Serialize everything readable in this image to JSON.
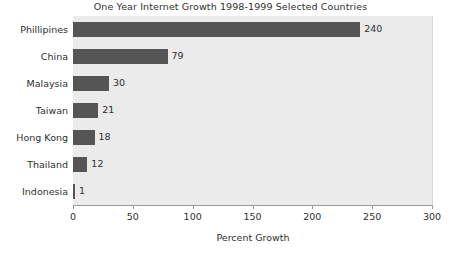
{
  "chart_data": {
    "type": "bar",
    "orientation": "horizontal",
    "title": "One Year Internet Growth 1998-1999 Selected Countries",
    "xlabel": "Percent Growth",
    "ylabel": "",
    "categories": [
      "Phillipines",
      "China",
      "Malaysia",
      "Taiwan",
      "Hong Kong",
      "Thailand",
      "Indonesia"
    ],
    "values": [
      240,
      79,
      30,
      21,
      18,
      12,
      1
    ],
    "value_labels": [
      "240",
      "79",
      "30",
      "21",
      "18",
      "12",
      "1"
    ],
    "xlim": [
      0,
      300
    ],
    "xticks": [
      0,
      50,
      100,
      150,
      200,
      250,
      300
    ],
    "xtick_labels": [
      "0",
      "50",
      "100",
      "150",
      "200",
      "250",
      "300"
    ],
    "grid": false,
    "legend": false,
    "colors": {
      "bar": "#555555",
      "plot_background": "#ebebeb",
      "page_background": "#ffffff",
      "axis": "#9a9a9a",
      "text": "#2f2f2f"
    }
  }
}
